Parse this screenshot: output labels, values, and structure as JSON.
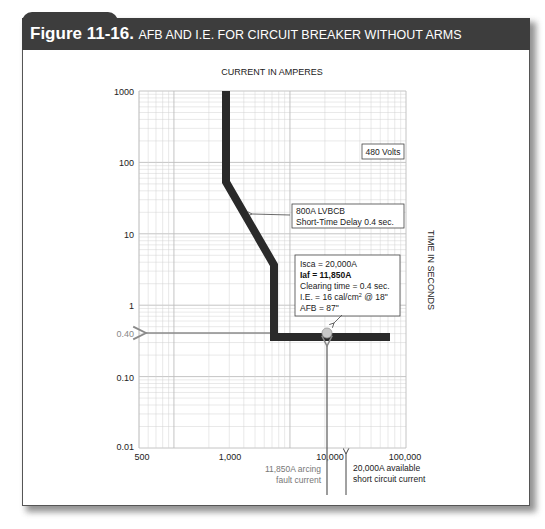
{
  "figure": {
    "number_label": "Figure 11-16.",
    "title": "AFB AND I.E. FOR CIRCUIT BREAKER WITHOUT ARMS"
  },
  "colors": {
    "header_bg": "#3d3d3d",
    "curve": "#2a2a2a",
    "grid": "#cfcfcf",
    "arrow": "#8a8a8a",
    "dot": "#c8c8c8"
  },
  "chart_data": {
    "type": "line",
    "title": "AFB AND I.E. FOR CIRCUIT BREAKER WITHOUT ARMS",
    "xlabel": "CURRENT IN AMPERES",
    "ylabel": "TIME IN SECONDS",
    "xscale": "log",
    "yscale": "log",
    "xlim": [
      500,
      100000
    ],
    "ylim": [
      0.01,
      1000
    ],
    "grid": true,
    "x_tick_labels": [
      "500",
      "1,000",
      "10,000",
      "100,000"
    ],
    "y_tick_labels": [
      "1000",
      "100",
      "10",
      "1",
      "0.40",
      "0.10",
      "0.01"
    ],
    "series": [
      {
        "name": "800A LVBCB Short-Time Delay 0.4 sec.",
        "x": [
          900,
          900,
          3200,
          3200,
          70000
        ],
        "y": [
          1000,
          50,
          3.5,
          0.4,
          0.4
        ]
      }
    ],
    "annotations": {
      "voltage": "480 Volts",
      "breaker_label_1": "800A LVBCB",
      "breaker_label_2": "Short-Time Delay 0.4 sec.",
      "isca": "Isca = 20,000A",
      "iaf": "Iaf = 11,850A",
      "clearing_time": "Clearing time = 0.4 sec.",
      "ie_prefix": "I.E. = 16 cal/cm",
      "ie_sup": "2",
      "ie_suffix": " @ 18\"",
      "afb": "AFB = 87\"",
      "arcing_1": "11,850A arcing",
      "arcing_2": "fault current",
      "available_1": "20,000A available",
      "available_2": "short circuit current",
      "operating_point": {
        "current": 11850,
        "time": 0.4
      }
    }
  }
}
